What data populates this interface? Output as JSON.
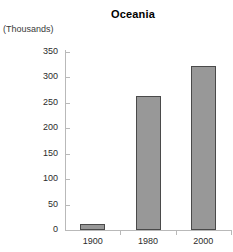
{
  "chart_data": {
    "type": "bar",
    "title": "Oceania",
    "units_label": "(Thousands)",
    "xlabel": "",
    "ylabel": "",
    "categories": [
      "1900",
      "1980",
      "2000"
    ],
    "values": [
      12,
      263,
      322
    ],
    "ylim": [
      0,
      350
    ],
    "yticks": [
      0,
      50,
      100,
      150,
      200,
      250,
      300,
      350
    ],
    "ytick_labels": [
      "0",
      "50",
      "100",
      "150",
      "200",
      "250",
      "300",
      "350"
    ],
    "grid": false,
    "legend": "none",
    "series": [
      {
        "name": "Oceania",
        "values": [
          12,
          263,
          322
        ]
      }
    ],
    "colors": {
      "bar_fill": "#989898",
      "bar_border": "#4a4a4a",
      "axis": "#b9b9b9",
      "text": "#2b2b2b",
      "title": "#000000",
      "background": "#ffffff"
    }
  }
}
